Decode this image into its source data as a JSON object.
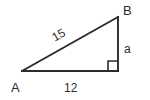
{
  "figure": {
    "type": "right-triangle-diagram",
    "background_color": "#ffffff",
    "stroke_color": "#2b2b2b",
    "vertices": {
      "a": {
        "label": "A",
        "x": 22,
        "y": 71
      },
      "b": {
        "label": "B",
        "x": 118,
        "y": 17
      },
      "c": {
        "label": "",
        "x": 118,
        "y": 71
      }
    },
    "sides": {
      "hypotenuse": {
        "label": "15",
        "from": "A",
        "to": "B"
      },
      "base": {
        "label": "12",
        "from": "A",
        "to": "C"
      },
      "vertical": {
        "label": "a",
        "from": "C",
        "to": "B"
      }
    },
    "right_angle": {
      "at": "C",
      "marker": "square",
      "size": 10
    }
  }
}
